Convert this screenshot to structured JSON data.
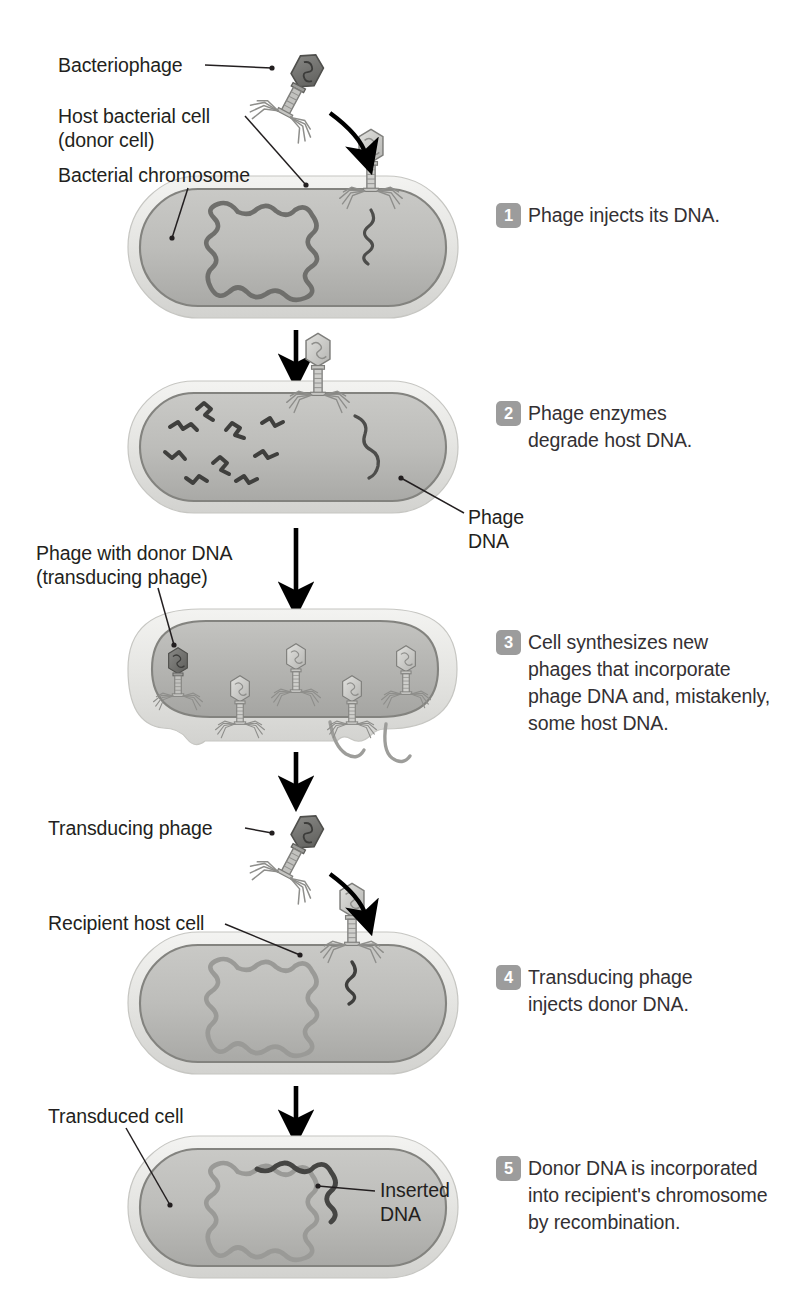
{
  "diagram": {
    "palette": {
      "ink": "#231f20",
      "step_text": "#333033",
      "badge_bg": "#9c9c9c",
      "badge_text": "#ffffff",
      "cell_wall": "#e9e9e7",
      "cell_wall_edge": "#cfcfcb",
      "cytoplasm": "#b9b9b6",
      "cytoplasm_edge": "#8b8b88",
      "chromosome": "#6d6d6a",
      "chromosome_light": "#9a9a97",
      "donor_dna": "#4a4a48",
      "phage_body": "#cfcfcc",
      "phage_head_dark": "#6a6a67",
      "arrow": "#000000"
    }
  },
  "labels": [
    {
      "id": "bacteriophage",
      "text": "Bacteriophage"
    },
    {
      "id": "host-cell-l1",
      "text": "Host bacterial cell"
    },
    {
      "id": "host-cell-l2",
      "text": "(donor cell)"
    },
    {
      "id": "bacterial-chromosome",
      "text": "Bacterial chromosome"
    },
    {
      "id": "phage-dna-l1",
      "text": "Phage"
    },
    {
      "id": "phage-dna-l2",
      "text": "DNA"
    },
    {
      "id": "donor-phage-l1",
      "text": "Phage with donor DNA"
    },
    {
      "id": "donor-phage-l2",
      "text": "(transducing phage)"
    },
    {
      "id": "transducing-phage",
      "text": "Transducing phage"
    },
    {
      "id": "recipient-host-cell",
      "text": "Recipient host cell"
    },
    {
      "id": "transduced-cell",
      "text": "Transduced cell"
    },
    {
      "id": "inserted-dna-l1",
      "text": "Inserted"
    },
    {
      "id": "inserted-dna-l2",
      "text": "DNA"
    }
  ],
  "steps": [
    {
      "number": "1",
      "lines": [
        "Phage injects its DNA."
      ]
    },
    {
      "number": "2",
      "lines": [
        "Phage enzymes",
        "degrade host DNA."
      ]
    },
    {
      "number": "3",
      "lines": [
        "Cell synthesizes new",
        "phages that incorporate",
        "phage DNA and, mistakenly,",
        "some host DNA."
      ]
    },
    {
      "number": "4",
      "lines": [
        "Transducing phage",
        "injects donor DNA."
      ]
    },
    {
      "number": "5",
      "lines": [
        "Donor DNA is incorporated",
        "into recipient's chromosome",
        "by recombination."
      ]
    }
  ]
}
